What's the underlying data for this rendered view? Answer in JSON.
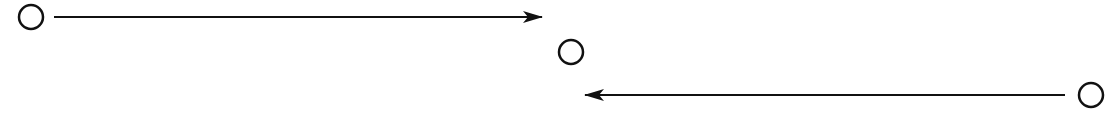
{
  "diagram": {
    "canvas": {
      "width": 1119,
      "height": 119,
      "background": "#ffffff"
    },
    "stroke_color": "#111111",
    "nodes": [
      {
        "id": "node-left",
        "shape": "circle",
        "cx": 31,
        "cy": 17,
        "r": 12
      },
      {
        "id": "node-middle",
        "shape": "circle",
        "cx": 571,
        "cy": 52,
        "r": 12
      },
      {
        "id": "node-right",
        "shape": "circle",
        "cx": 1091,
        "cy": 95,
        "r": 12
      }
    ],
    "edges": [
      {
        "id": "edge-left-to-middle",
        "from": "node-left",
        "direction": "right",
        "x1": 54,
        "y1": 17,
        "x2": 542,
        "y2": 17
      },
      {
        "id": "edge-right-to-middle",
        "from": "node-right",
        "direction": "left",
        "x1": 1065,
        "y1": 95,
        "x2": 585,
        "y2": 95
      }
    ]
  }
}
